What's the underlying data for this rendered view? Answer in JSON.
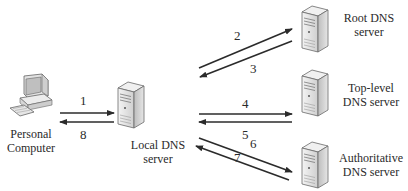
{
  "diagram": {
    "title": "",
    "nodes": [
      {
        "id": "pc",
        "icon": "personal-computer-icon",
        "label_lines": [
          "Personal",
          "Computer"
        ]
      },
      {
        "id": "local",
        "icon": "server-icon",
        "label_lines": [
          "Local DNS",
          "server"
        ]
      },
      {
        "id": "root",
        "icon": "server-icon",
        "label_lines": [
          "Root DNS",
          "server"
        ]
      },
      {
        "id": "tld",
        "icon": "server-icon",
        "label_lines": [
          "Top-level",
          "DNS server"
        ]
      },
      {
        "id": "auth",
        "icon": "server-icon",
        "label_lines": [
          "Authoritative",
          "DNS server"
        ]
      }
    ],
    "edges": [
      {
        "step": "1",
        "from": "pc",
        "to": "local"
      },
      {
        "step": "2",
        "from": "local",
        "to": "root"
      },
      {
        "step": "3",
        "from": "root",
        "to": "local"
      },
      {
        "step": "4",
        "from": "local",
        "to": "tld"
      },
      {
        "step": "5",
        "from": "tld",
        "to": "local"
      },
      {
        "step": "6",
        "from": "local",
        "to": "auth"
      },
      {
        "step": "7",
        "from": "auth",
        "to": "local"
      },
      {
        "step": "8",
        "from": "local",
        "to": "pc"
      }
    ],
    "colors": {
      "arrow": "#2b2b2b",
      "server_body": "#e8e8e8",
      "server_edge": "#6a6a6a"
    }
  }
}
